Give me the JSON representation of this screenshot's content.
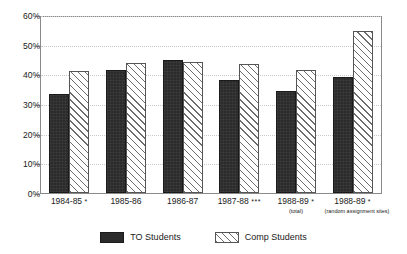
{
  "chart_data": {
    "type": "bar",
    "title": "",
    "subtitle": "",
    "xlabel": "",
    "ylabel": "",
    "ylim": [
      0,
      60
    ],
    "y_tick_labels": [
      "0%",
      "10%",
      "20%",
      "30%",
      "40%",
      "50%",
      "60%"
    ],
    "y_tick_values": [
      0,
      10,
      20,
      30,
      40,
      50,
      60
    ],
    "grid": true,
    "grid_axis": "y",
    "legend_position": "bottom",
    "categories": [
      "1984-85",
      "1985-86",
      "1986-87",
      "1987-88",
      "1988-89",
      "1988-89"
    ],
    "category_markers": [
      "*",
      "",
      "",
      "***",
      "*",
      "*"
    ],
    "category_sublabels": [
      "",
      "",
      "",
      "",
      "(total)",
      "(random assignment sites)"
    ],
    "series": [
      {
        "name": "TO Students",
        "pattern": "solid-dark",
        "color": "#2b2b2b",
        "values": [
          33.9,
          42.0,
          45.2,
          38.5,
          34.7,
          39.5
        ]
      },
      {
        "name": "Comp Students",
        "pattern": "diagonal-hatch",
        "color": "#ffffff",
        "values": [
          41.7,
          44.2,
          44.6,
          44.0,
          41.8,
          55.2
        ]
      }
    ]
  },
  "legend": {
    "items": [
      {
        "label": "TO Students",
        "swatch": "solid-dark-swatch"
      },
      {
        "label": "Comp Students",
        "swatch": "hatch-swatch"
      }
    ]
  }
}
